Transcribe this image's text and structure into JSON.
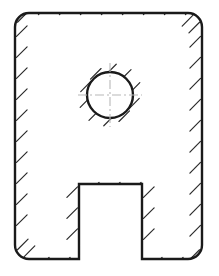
{
  "drawing": {
    "title": "Sectioned block with circular hole and bottom notch",
    "canvas": {
      "width": 219,
      "height": 276,
      "background": "#ffffff"
    },
    "style": {
      "outline_color": "#1a1a1a",
      "outline_width": 2.4,
      "hatch_color": "#2b2b2b",
      "hatch_width": 1.2,
      "centerline_color": "#b8b8b8",
      "centerline_width": 1.1,
      "fill_color": "#ffffff",
      "hatch_angle_deg": 45,
      "hatch_length": 15,
      "hatch_spacing": 21
    },
    "outer_body": {
      "name": "rounded-rectangle-block",
      "left": 15,
      "top": 13,
      "right": 202,
      "bottom": 259,
      "width": 187,
      "height": 246,
      "corner_radius": 14
    },
    "hole": {
      "name": "circular-hole",
      "center_x": 110,
      "center_y": 95,
      "radius": 23,
      "diameter": 46
    },
    "notch": {
      "name": "bottom-rectangular-notch",
      "left": 79,
      "right": 142,
      "top": 184,
      "bottom": 259,
      "width": 63,
      "height": 75
    },
    "centerlines": {
      "horizontal": {
        "x1": 78,
        "y1": 95,
        "x2": 142,
        "y2": 95
      },
      "vertical": {
        "x1": 110,
        "y1": 63,
        "x2": 110,
        "y2": 127
      },
      "dash_pattern": "9 3 2 3"
    },
    "labels": {
      "figure_caption": "",
      "hole_label": "",
      "notch_label": ""
    }
  }
}
